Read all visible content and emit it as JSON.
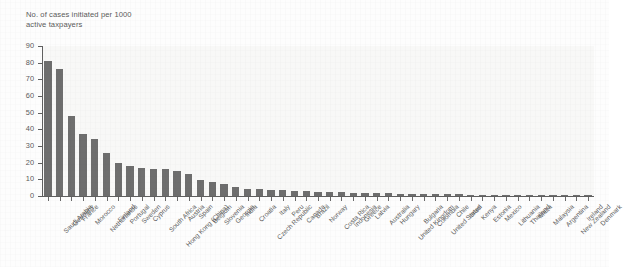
{
  "chart_data": {
    "type": "bar",
    "title": "",
    "ylabel": "No. of cases initiated per 1000\nactive taxpayers",
    "xlabel": "",
    "ylim": [
      0,
      90
    ],
    "yticks": [
      0,
      10,
      20,
      30,
      40,
      50,
      60,
      70,
      80,
      90
    ],
    "grid": false,
    "legend": null,
    "bar_color": "#6e6e6e",
    "categories": [
      "Saudi Arabia",
      "Germany",
      "France",
      "Morocco",
      "Netherlands",
      "Finland",
      "Portugal",
      "Sweden",
      "Cyprus",
      "South Africa",
      "Hong Kong (China)",
      "Austria",
      "Spain",
      "Belgium",
      "Slovenia",
      "Georgia",
      "India",
      "Croatia",
      "Czech Republic",
      "Italy",
      "Peru",
      "Canada",
      "Brazil",
      "Norway",
      "Costa Rica",
      "Indonesia",
      "Greece",
      "Latvia",
      "Australia",
      "Hungary",
      "United Kingdom",
      "Bulgaria",
      "Colombia",
      "United States",
      "Chile",
      "Israel",
      "Kenya",
      "Estonia",
      "Mexico",
      "Lithuania",
      "Thailand",
      "Malta",
      "Malaysia",
      "Argentina",
      "New Zealand",
      "Ireland",
      "Denmark"
    ],
    "values": [
      81,
      76,
      48,
      37,
      34,
      26,
      20,
      18,
      17,
      16.5,
      16,
      15,
      13,
      9.5,
      8.5,
      7,
      5.5,
      4.5,
      4.2,
      3.8,
      3.4,
      3.2,
      3.0,
      2.7,
      2.4,
      2.2,
      2.0,
      1.9,
      1.7,
      1.6,
      1.5,
      1.4,
      1.3,
      1.2,
      1.1,
      1.0,
      0.9,
      0.85,
      0.8,
      0.75,
      0.7,
      0.6,
      0.55,
      0.5,
      0.45,
      0.4,
      0.35
    ]
  }
}
